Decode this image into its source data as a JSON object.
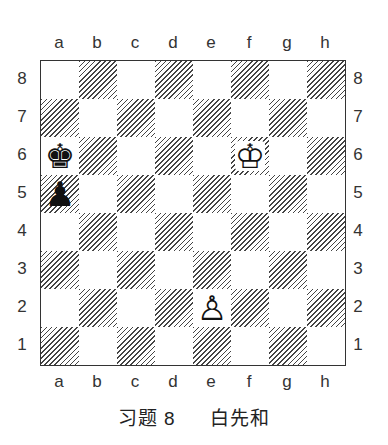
{
  "files": [
    "a",
    "b",
    "c",
    "d",
    "e",
    "f",
    "g",
    "h"
  ],
  "ranks": [
    "8",
    "7",
    "6",
    "5",
    "4",
    "3",
    "2",
    "1"
  ],
  "pieces": [
    {
      "square": "a6",
      "piece": "king",
      "color": "black",
      "glyph": "♚"
    },
    {
      "square": "a5",
      "piece": "pawn",
      "color": "black",
      "glyph": "♟"
    },
    {
      "square": "f6",
      "piece": "king",
      "color": "white",
      "glyph": "♔"
    },
    {
      "square": "e2",
      "piece": "pawn",
      "color": "white",
      "glyph": "♙"
    }
  ],
  "caption": {
    "title": "习题 8",
    "subtitle": "白先和"
  },
  "colors": {
    "dark_square_hatch": "#444444",
    "light_square": "#ffffff",
    "border": "#333333"
  }
}
